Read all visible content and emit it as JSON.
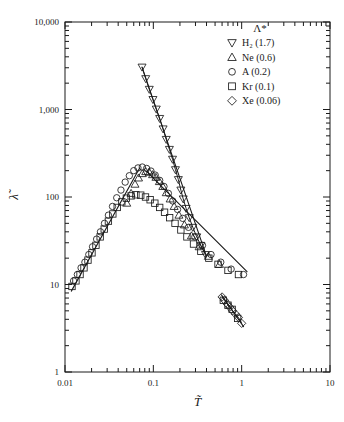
{
  "figure": {
    "background": "#ffffff",
    "ink": "#1a1a1a"
  },
  "axes": {
    "x": {
      "label": "T̃",
      "label_plain": "T~",
      "scale": "log",
      "min": 0.01,
      "max": 10,
      "ticks": [
        "0.01",
        "0.1",
        "1",
        "10"
      ],
      "tick_values": [
        0.01,
        0.1,
        1,
        10
      ]
    },
    "y": {
      "label": "λ̃",
      "label_plain": "lambda~",
      "scale": "log",
      "min": 1,
      "max": 10000,
      "ticks": [
        "1",
        "10",
        "100",
        "1,000",
        "10,000"
      ],
      "tick_values": [
        1,
        10,
        100,
        1000,
        10000
      ]
    }
  },
  "legend": {
    "title": "Λ*",
    "position": "top-right",
    "entries": [
      {
        "marker": "down-triangle",
        "label": "H₂ (1.7)",
        "species": "H2",
        "lambda_star": "1.7"
      },
      {
        "marker": "up-triangle",
        "label": "Ne (0.6)",
        "species": "Ne",
        "lambda_star": "0.6"
      },
      {
        "marker": "circle",
        "label": "A (0.2)",
        "species": "A",
        "lambda_star": "0.2"
      },
      {
        "marker": "square",
        "label": "Kr (0.1)",
        "species": "Kr",
        "lambda_star": "0.1"
      },
      {
        "marker": "diamond",
        "label": "Xe (0.06)",
        "species": "Xe",
        "lambda_star": "0.06"
      }
    ]
  },
  "chart_data": {
    "type": "scatter",
    "title": "",
    "xlabel": "T̃",
    "ylabel": "λ̃",
    "xscale": "log",
    "yscale": "log",
    "xlim": [
      0.01,
      10
    ],
    "ylim": [
      1,
      10000
    ],
    "grid": false,
    "legend_position": "top-right",
    "legend_title": "Λ*",
    "series": [
      {
        "name": "H₂ (1.7)",
        "marker": "down-triangle",
        "line": true,
        "points": [
          [
            0.0745,
            3050
          ],
          [
            0.082,
            2250
          ],
          [
            0.09,
            1700
          ],
          [
            0.099,
            1300
          ],
          [
            0.108,
            1010
          ],
          [
            0.118,
            790
          ],
          [
            0.129,
            600
          ],
          [
            0.14,
            455
          ],
          [
            0.152,
            350
          ],
          [
            0.165,
            270
          ],
          [
            0.178,
            205
          ],
          [
            0.192,
            158
          ],
          [
            0.205,
            120
          ],
          [
            0.218,
            95
          ],
          [
            0.235,
            74
          ],
          [
            0.255,
            58
          ],
          [
            0.28,
            45
          ],
          [
            0.31,
            35
          ],
          [
            0.345,
            28
          ],
          [
            0.39,
            22
          ]
        ]
      },
      {
        "name": "Ne (0.6)",
        "marker": "up-triangle",
        "line": false,
        "points": [
          [
            0.05,
            85
          ],
          [
            0.056,
            110
          ],
          [
            0.062,
            140
          ],
          [
            0.068,
            165
          ],
          [
            0.075,
            185
          ],
          [
            0.082,
            195
          ],
          [
            0.09,
            192
          ],
          [
            0.098,
            180
          ],
          [
            0.107,
            168
          ],
          [
            0.117,
            150
          ],
          [
            0.128,
            132
          ],
          [
            0.14,
            112
          ],
          [
            0.155,
            95
          ],
          [
            0.172,
            78
          ],
          [
            0.195,
            62
          ],
          [
            0.225,
            48
          ],
          [
            0.27,
            36
          ],
          [
            0.33,
            27
          ],
          [
            0.42,
            21
          ],
          [
            0.56,
            17
          ]
        ]
      },
      {
        "name": "A (0.2)",
        "marker": "circle",
        "line": false,
        "points": [
          [
            0.0125,
            11
          ],
          [
            0.0138,
            13
          ],
          [
            0.0152,
            15.5
          ],
          [
            0.0168,
            18
          ],
          [
            0.0186,
            22
          ],
          [
            0.0205,
            27
          ],
          [
            0.0228,
            33
          ],
          [
            0.0252,
            40
          ],
          [
            0.028,
            50
          ],
          [
            0.031,
            62
          ],
          [
            0.0345,
            78
          ],
          [
            0.0385,
            98
          ],
          [
            0.043,
            120
          ],
          [
            0.048,
            148
          ],
          [
            0.0535,
            175
          ],
          [
            0.06,
            200
          ],
          [
            0.067,
            215
          ],
          [
            0.075,
            220
          ],
          [
            0.084,
            212
          ],
          [
            0.094,
            198
          ],
          [
            0.105,
            178
          ],
          [
            0.118,
            155
          ],
          [
            0.132,
            132
          ],
          [
            0.148,
            110
          ],
          [
            0.166,
            90
          ],
          [
            0.188,
            72
          ],
          [
            0.215,
            57
          ],
          [
            0.25,
            45
          ],
          [
            0.295,
            35
          ],
          [
            0.36,
            28
          ],
          [
            0.45,
            22
          ],
          [
            0.58,
            18
          ],
          [
            0.76,
            15
          ],
          [
            1.05,
            13
          ]
        ]
      },
      {
        "name": "Kr (0.1)",
        "marker": "square",
        "line": false,
        "points": [
          [
            0.012,
            9.5
          ],
          [
            0.0133,
            11
          ],
          [
            0.0148,
            13
          ],
          [
            0.0164,
            15.5
          ],
          [
            0.0182,
            19
          ],
          [
            0.0202,
            23
          ],
          [
            0.0224,
            28
          ],
          [
            0.025,
            35
          ],
          [
            0.0278,
            43
          ],
          [
            0.031,
            53
          ],
          [
            0.0348,
            64
          ],
          [
            0.039,
            76
          ],
          [
            0.044,
            88
          ],
          [
            0.0495,
            97
          ],
          [
            0.056,
            103
          ],
          [
            0.0635,
            106
          ],
          [
            0.072,
            105
          ],
          [
            0.0815,
            100
          ],
          [
            0.092,
            93
          ],
          [
            0.104,
            85
          ],
          [
            0.118,
            76
          ],
          [
            0.134,
            67
          ],
          [
            0.153,
            58
          ],
          [
            0.176,
            50
          ],
          [
            0.205,
            42
          ],
          [
            0.24,
            35
          ],
          [
            0.285,
            29
          ],
          [
            0.345,
            24
          ],
          [
            0.425,
            20
          ],
          [
            0.54,
            17
          ],
          [
            0.7,
            14.5
          ],
          [
            0.92,
            13
          ],
          [
            0.62,
            6.6
          ],
          [
            0.7,
            5.8
          ],
          [
            0.78,
            5.2
          ],
          [
            0.9,
            4.1
          ]
        ]
      },
      {
        "name": "Xe (0.06)",
        "marker": "diamond",
        "line": true,
        "points": [
          [
            0.6,
            7.2
          ],
          [
            0.64,
            6.6
          ],
          [
            0.685,
            6.0
          ],
          [
            0.735,
            5.5
          ],
          [
            0.79,
            5.0
          ],
          [
            0.85,
            4.6
          ],
          [
            0.92,
            4.2
          ],
          [
            1.0,
            3.6
          ]
        ]
      }
    ],
    "guide_lines": [
      {
        "name": "left-rising-branch",
        "from": [
          0.0118,
          8.4
        ],
        "to": [
          0.07,
          215
        ]
      },
      {
        "name": "h2-descending-line",
        "from": [
          0.0745,
          3050
        ],
        "to": [
          0.4,
          21
        ]
      },
      {
        "name": "main-descending-branch",
        "from": [
          0.082,
          200
        ],
        "to": [
          1.15,
          14
        ]
      },
      {
        "name": "xe-descending-line",
        "from": [
          0.59,
          7.6
        ],
        "to": [
          1.05,
          3.3
        ]
      }
    ]
  }
}
